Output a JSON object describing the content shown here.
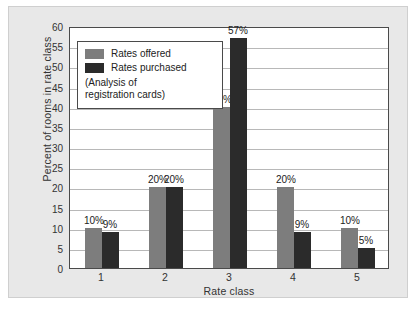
{
  "chart_data": {
    "type": "bar",
    "title": "",
    "xlabel": "Rate class",
    "ylabel": "Percent of rooms in rate class",
    "categories": [
      "1",
      "2",
      "3",
      "4",
      "5"
    ],
    "series": [
      {
        "name": "Rates offered",
        "color": "#7d7d7d",
        "values": [
          10,
          20,
          40,
          20,
          10
        ],
        "labels": [
          "10%",
          "20%",
          "40%",
          "20%",
          "10%"
        ]
      },
      {
        "name": "Rates purchased",
        "color": "#2b2b2b",
        "values": [
          9,
          20,
          57,
          9,
          5
        ],
        "labels": [
          "9%",
          "20%",
          "57%",
          "9%",
          "5%"
        ]
      }
    ],
    "ylim": [
      0,
      60
    ],
    "yticks": [
      0,
      5,
      10,
      15,
      20,
      25,
      30,
      35,
      40,
      45,
      50,
      55,
      60
    ],
    "ytick_labels": [
      "0",
      "5",
      "10",
      "15",
      "20",
      "25",
      "30",
      "35",
      "40",
      "45",
      "50",
      "55",
      "60"
    ],
    "grid": true,
    "legend_position": "upper-left",
    "annotation": "(Analysis of registration cards)"
  },
  "legend": {
    "items": [
      {
        "label": "Rates offered"
      },
      {
        "label": "Rates purchased"
      }
    ],
    "note_line1": "(Analysis of",
    "note_line2": "registration cards)"
  },
  "colors": {
    "offered": "#7d7d7d",
    "purchased": "#2b2b2b",
    "panel_background": "#e8e8e8",
    "plot_background": "#ffffff",
    "axis": "#4a4a4a",
    "gridline": "#b8b8b8"
  }
}
